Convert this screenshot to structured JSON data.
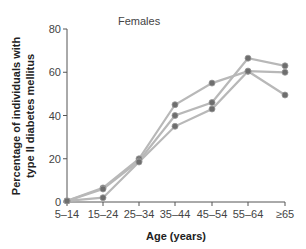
{
  "chart_data": {
    "type": "line",
    "title": "Females",
    "xlabel": "Age (years)",
    "ylabel_line1": "Percentage of individuals with",
    "ylabel_line2": "type II diabetes mellitus",
    "ylim": [
      0,
      80
    ],
    "yticks": [
      "0",
      "20",
      "40",
      "60",
      "80"
    ],
    "categories": [
      "5–14",
      "15–24",
      "25–34",
      "35–44",
      "45–54",
      "55–64",
      "≥65"
    ],
    "grid": false,
    "legend": null,
    "series": [
      {
        "name": "Series 1",
        "values": [
          0.5,
          6.5,
          20,
          45,
          55,
          60.5,
          60
        ]
      },
      {
        "name": "Series 2",
        "values": [
          0.5,
          6,
          19,
          40,
          46,
          66.5,
          63
        ]
      },
      {
        "name": "Series 3",
        "values": [
          0.5,
          2,
          18.5,
          35,
          43,
          60.5,
          49.5
        ]
      }
    ],
    "colors": {
      "line": "#b8b8b8",
      "marker": "#6e6e6e",
      "axis": "#555555"
    }
  }
}
